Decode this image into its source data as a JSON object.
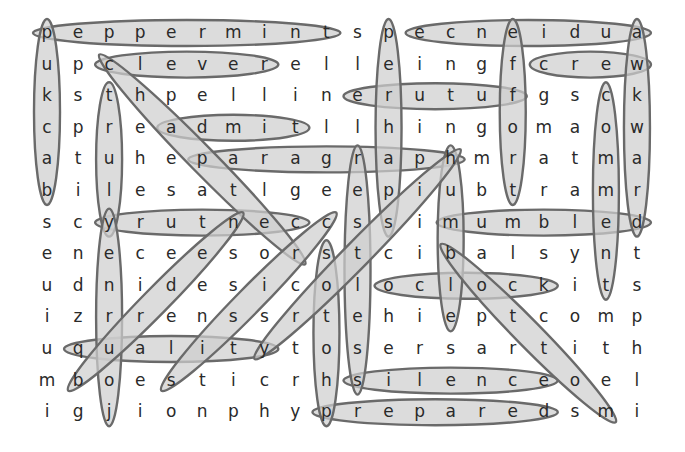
{
  "puzzle": {
    "type": "word-search",
    "rows": 13,
    "cols": 20,
    "grid": [
      "peppermintspecneidua",
      "upcleverelleingfcrew",
      "ksthpellinerutufgsck",
      "cpreadmitllhingomaow",
      "atheparagraphmratma",
      "bilesatlgeepiubtramr",
      "scyrutneccssimumbled",
      "enecees orstcibalsynt",
      "udnidesicoloclockits",
      "izrrenssrtehieptcomp",
      "uqualitytosersartith",
      "mboesticrhsilenceoel",
      "igjionphypreparedsmi"
    ],
    "grid_rows": [
      [
        "p",
        "e",
        "p",
        "p",
        "e",
        "r",
        "m",
        "i",
        "n",
        "t",
        "s",
        "p",
        "e",
        "c",
        "n",
        "e",
        "i",
        "d",
        "u",
        "a"
      ],
      [
        "u",
        "p",
        "c",
        "l",
        "e",
        "v",
        "e",
        "r",
        "e",
        "l",
        "l",
        "e",
        "i",
        "n",
        "g",
        "f",
        "c",
        "r",
        "e",
        "w"
      ],
      [
        "k",
        "s",
        "t",
        "h",
        "p",
        "e",
        "l",
        "l",
        "i",
        "n",
        "e",
        "r",
        "u",
        "t",
        "u",
        "f",
        "g",
        "s",
        "c",
        "k"
      ],
      [
        "c",
        "p",
        "r",
        "e",
        "a",
        "d",
        "m",
        "i",
        "t",
        "l",
        "l",
        "h",
        "i",
        "n",
        "g",
        "o",
        "m",
        "a",
        "o",
        "w"
      ],
      [
        "a",
        "t",
        "u",
        "h",
        "e",
        "p",
        "a",
        "r",
        "a",
        "g",
        "r",
        "a",
        "p",
        "h",
        "m",
        "r",
        "a",
        "t",
        "m",
        "a"
      ],
      [
        "b",
        "i",
        "l",
        "e",
        "s",
        "a",
        "t",
        "l",
        "g",
        "e",
        "e",
        "p",
        "i",
        "u",
        "b",
        "t",
        "r",
        "a",
        "m",
        "r"
      ],
      [
        "s",
        "c",
        "y",
        "r",
        "u",
        "t",
        "n",
        "e",
        "c",
        "c",
        "s",
        "s",
        "i",
        "m",
        "u",
        "m",
        "b",
        "l",
        "e",
        "d"
      ],
      [
        "e",
        "n",
        "e",
        "c",
        "e",
        "e",
        "s",
        "o",
        "r",
        "s",
        "t",
        "c",
        "i",
        "b",
        "a",
        "l",
        "s",
        "y",
        "n",
        "t"
      ],
      [
        "u",
        "d",
        "n",
        "i",
        "d",
        "e",
        "s",
        "i",
        "c",
        "o",
        "l",
        "o",
        "c",
        "l",
        "o",
        "c",
        "k",
        "i",
        "t",
        "s"
      ],
      [
        "i",
        "z",
        "r",
        "r",
        "e",
        "n",
        "s",
        "s",
        "r",
        "t",
        "e",
        "h",
        "i",
        "e",
        "p",
        "t",
        "c",
        "o",
        "m",
        "p"
      ],
      [
        "u",
        "q",
        "u",
        "a",
        "l",
        "i",
        "t",
        "y",
        "t",
        "o",
        "s",
        "e",
        "r",
        "s",
        "a",
        "r",
        "t",
        "i",
        "t",
        "h"
      ],
      [
        "m",
        "b",
        "o",
        "e",
        "s",
        "t",
        "i",
        "c",
        "r",
        "h",
        "s",
        "i",
        "l",
        "e",
        "n",
        "c",
        "e",
        "o",
        "e",
        "l"
      ],
      [
        "i",
        "g",
        "j",
        "i",
        "o",
        "n",
        "p",
        "h",
        "y",
        "p",
        "r",
        "e",
        "p",
        "a",
        "r",
        "e",
        "d",
        "s",
        "m",
        "i"
      ]
    ],
    "found_words": [
      {
        "word": "peppermint",
        "from": [
          1,
          1
        ],
        "to": [
          1,
          10
        ]
      },
      {
        "word": "audience",
        "from": [
          1,
          20
        ],
        "to": [
          1,
          13
        ]
      },
      {
        "word": "clever",
        "from": [
          2,
          3
        ],
        "to": [
          2,
          8
        ]
      },
      {
        "word": "crew",
        "from": [
          2,
          17
        ],
        "to": [
          2,
          20
        ]
      },
      {
        "word": "future",
        "from": [
          3,
          16
        ],
        "to": [
          3,
          11
        ]
      },
      {
        "word": "admit",
        "from": [
          4,
          5
        ],
        "to": [
          4,
          9
        ]
      },
      {
        "word": "paragraph",
        "from": [
          5,
          6
        ],
        "to": [
          5,
          14
        ]
      },
      {
        "word": "century",
        "from": [
          7,
          9
        ],
        "to": [
          7,
          3
        ]
      },
      {
        "word": "mumbled",
        "from": [
          7,
          14
        ],
        "to": [
          7,
          20
        ]
      },
      {
        "word": "oclock",
        "from": [
          9,
          12
        ],
        "to": [
          9,
          17
        ]
      },
      {
        "word": "quality",
        "from": [
          11,
          2
        ],
        "to": [
          11,
          8
        ]
      },
      {
        "word": "silence",
        "from": [
          12,
          11
        ],
        "to": [
          12,
          17
        ]
      },
      {
        "word": "prepared",
        "from": [
          13,
          10
        ],
        "to": [
          13,
          17
        ]
      },
      {
        "word": "backup",
        "from": [
          6,
          1
        ],
        "to": [
          1,
          1
        ]
      },
      {
        "word": "truly",
        "from": [
          3,
          3
        ],
        "to": [
          7,
          3
        ]
      },
      {
        "word": "journey",
        "from": [
          13,
          3
        ],
        "to": [
          7,
          3
        ]
      },
      {
        "word": "perhaps",
        "from": [
          1,
          12
        ],
        "to": [
          7,
          12
        ]
      },
      {
        "word": "restless",
        "from": [
          5,
          11
        ],
        "to": [
          12,
          11
        ]
      },
      {
        "word": "photos",
        "from": [
          13,
          10
        ],
        "to": [
          8,
          10
        ]
      },
      {
        "word": "humble",
        "from": [
          5,
          14
        ],
        "to": [
          10,
          14
        ]
      },
      {
        "word": "effort",
        "from": [
          1,
          16
        ],
        "to": [
          6,
          16
        ]
      },
      {
        "word": "comment",
        "from": [
          3,
          19
        ],
        "to": [
          9,
          19
        ]
      },
      {
        "word": "awkward",
        "from": [
          1,
          20
        ],
        "to": [
          7,
          20
        ]
      },
      {
        "word": "cheater",
        "from": [
          2,
          3
        ],
        "to": [
          8,
          9
        ]
      },
      {
        "word": "buried",
        "from": [
          12,
          2
        ],
        "to": [
          7,
          7
        ]
      },
      {
        "word": "strict",
        "from": [
          12,
          5
        ],
        "to": [
          7,
          10
        ]
      },
      {
        "word": "history",
        "from": [
          11,
          8
        ],
        "to": [
          5,
          14
        ]
      },
      {
        "word": "bottom",
        "from": [
          8,
          14
        ],
        "to": [
          13,
          19
        ]
      }
    ],
    "colors": {
      "letter": "#2a2a2a",
      "loop_fill": "#cfcfcf",
      "loop_stroke": "#6a6a6a",
      "background": "#ffffff"
    }
  }
}
